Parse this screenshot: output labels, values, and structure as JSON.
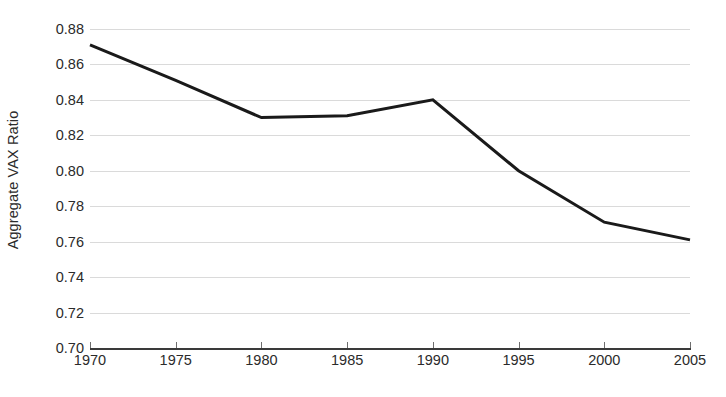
{
  "chart_data": {
    "type": "line",
    "title": "",
    "xlabel": "",
    "ylabel": "Aggregate VAX Ratio",
    "x": [
      1970,
      1975,
      1980,
      1985,
      1990,
      1995,
      2000,
      2005
    ],
    "xticklabels": [
      "1970",
      "1975",
      "1980",
      "1985",
      "1990",
      "1995",
      "2000",
      "2005"
    ],
    "xlim": [
      1970,
      2005
    ],
    "ylim": [
      0.7,
      0.88
    ],
    "yticks": [
      0.7,
      0.72,
      0.74,
      0.76,
      0.78,
      0.8,
      0.82,
      0.84,
      0.86,
      0.88
    ],
    "yticklabels": [
      "0.88",
      "0.86",
      "0.84",
      "0.82",
      "0.80",
      "0.78",
      "0.76",
      "0.74",
      "0.72",
      "0.70"
    ],
    "grid": "horizontal",
    "legend": "none",
    "series": [
      {
        "name": "Aggregate VAX Ratio",
        "color": "#1a1a1a",
        "line_width": 3,
        "markers": "none",
        "values": [
          0.871,
          0.851,
          0.83,
          0.831,
          0.84,
          0.8,
          0.771,
          0.761
        ]
      }
    ]
  },
  "colors": {
    "line": "#1a1a1a",
    "gridline": "#dadada",
    "axis": "#3a3a3a",
    "tick_mark": "#6e6e6e",
    "text": "#2b2b2b",
    "background": "#ffffff"
  }
}
